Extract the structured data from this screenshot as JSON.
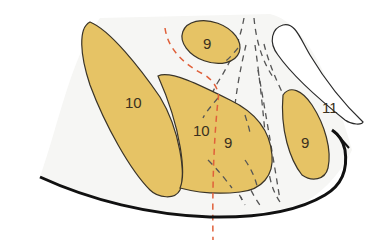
{
  "diagram": {
    "colors": {
      "region_fill": "#e6c365",
      "region_stroke": "#3a3428",
      "background_tint": "#f6f6f4",
      "boundary": "#111111",
      "red_dashed": "#e0603a",
      "gray_dashed": "#555555"
    },
    "labels": {
      "left_large_region": "10",
      "top_small_region": "9",
      "middle_region_left": "10",
      "middle_region_right": "9",
      "right_elongated_region": "9",
      "right_white_structure": "11"
    }
  }
}
